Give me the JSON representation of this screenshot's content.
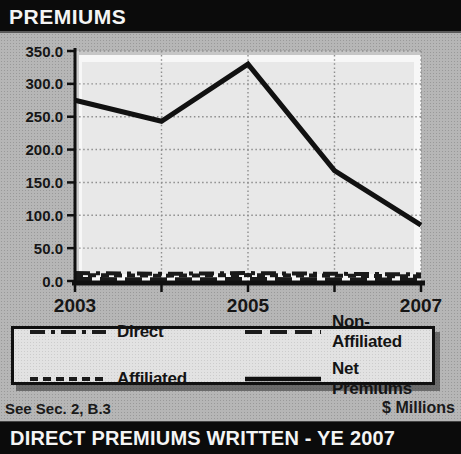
{
  "header": {
    "title": "PREMIUMS"
  },
  "footer": {
    "note": "See Sec. 2, B.3",
    "units": "$ Millions"
  },
  "bottom_bar": {
    "title": "DIRECT PREMIUMS WRITTEN - YE 2007"
  },
  "legend": {
    "items": [
      {
        "label": "Direct",
        "series": "Direct"
      },
      {
        "label": "Non-Affiliated",
        "series": "Non-Affiliated"
      },
      {
        "label": "Affiliated",
        "series": "Affiliated"
      },
      {
        "label": "Net Premiums",
        "series": "Net Premiums"
      }
    ]
  },
  "chart_data": {
    "type": "line",
    "title": "PREMIUMS",
    "xlabel": "",
    "ylabel": "",
    "units": "$ Millions",
    "grid": true,
    "legend_position": "below",
    "x": [
      2003,
      2004,
      2005,
      2006,
      2007
    ],
    "x_ticks": [
      2003,
      2004,
      2005,
      2006,
      2007
    ],
    "x_labels": [
      {
        "value": 2003,
        "text": "2003"
      },
      {
        "value": 2005,
        "text": "2005"
      },
      {
        "value": 2007,
        "text": "2007"
      }
    ],
    "ylim": [
      0,
      350
    ],
    "y_ticks": [
      0,
      50,
      100,
      150,
      200,
      250,
      300,
      350
    ],
    "y_tick_labels": [
      "0.0",
      "50.0",
      "100.0",
      "150.0",
      "200.0",
      "250.0",
      "300.0",
      "350.0"
    ],
    "series": [
      {
        "name": "Direct",
        "dash": "dashdot",
        "width": 4,
        "color": "#1a1a1a",
        "values": [
          12,
          11,
          12,
          11,
          10
        ]
      },
      {
        "name": "Non-Affiliated",
        "dash": "longdash",
        "width": 4,
        "color": "#1a1a1a",
        "values": [
          3,
          2.5,
          3,
          2.5,
          2
        ]
      },
      {
        "name": "Affiliated",
        "dash": "shortdash",
        "width": 4,
        "color": "#1a1a1a",
        "values": [
          9,
          8,
          9,
          8,
          7
        ]
      },
      {
        "name": "Net Premiums",
        "dash": "solid",
        "width": 5,
        "color": "#111111",
        "values": [
          275,
          243,
          330,
          168,
          85
        ]
      }
    ]
  }
}
